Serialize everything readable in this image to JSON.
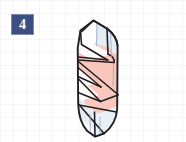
{
  "page": {
    "background_color": "#ffffff",
    "grid_visible": true,
    "grid_color": "#96a0b0",
    "width": 186,
    "height": 142
  },
  "step_badge": {
    "label": "4",
    "background_color": "#3d4f82",
    "text_color": "#ffffff"
  },
  "figure": {
    "name": "origami-rolled-cone-step-4",
    "colors": {
      "paper_pink": "#f9c7be",
      "paper_pale_blue": "#e7eef4",
      "paper_white": "#fdfdfd",
      "outline": "#231f20",
      "fold_line": "#5d6b84"
    },
    "outline_width": 1.7,
    "fold_line_width": 0.8,
    "panels": [
      {
        "name": "top-left-white-flap",
        "fill": "paper_white"
      },
      {
        "name": "top-right-pale-panel",
        "fill": "paper_pale_blue"
      },
      {
        "name": "upper-pink-wrap",
        "fill": "paper_pink"
      },
      {
        "name": "mid-white-wedge",
        "fill": "paper_white"
      },
      {
        "name": "mid-pink-band",
        "fill": "paper_pink"
      },
      {
        "name": "lower-white-wedge",
        "fill": "paper_white"
      },
      {
        "name": "lower-pink-band",
        "fill": "paper_pink"
      },
      {
        "name": "bottom-pale-panel",
        "fill": "paper_pale_blue"
      },
      {
        "name": "bottom-tip-white",
        "fill": "paper_white"
      }
    ]
  }
}
